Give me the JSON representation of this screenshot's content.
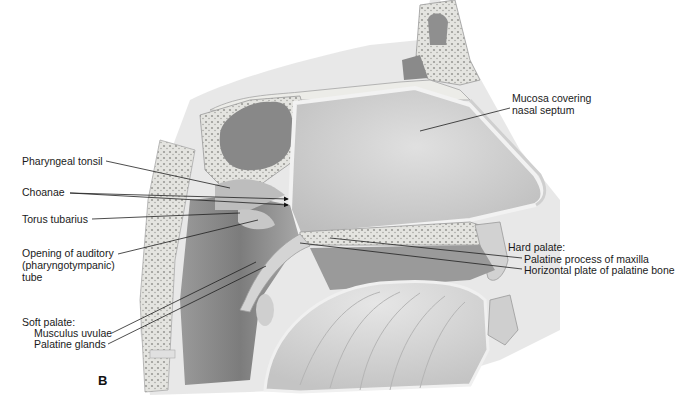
{
  "figure": {
    "panel_letter": "B"
  },
  "labels": {
    "pharyngeal_tonsil": "Pharyngeal tonsil",
    "choanae": "Choanae",
    "torus_tubarius": "Torus tubarius",
    "auditory_tube": [
      "Opening of auditory",
      "(pharyngotympanic)",
      "tube"
    ],
    "soft_palate": {
      "heading": "Soft palate:",
      "items": [
        "Musculus uvulae",
        "Palatine glands"
      ]
    },
    "mucosa": [
      "Mucosa covering",
      "nasal septum"
    ],
    "hard_palate": {
      "heading": "Hard palate:",
      "items": [
        "Palatine process of maxilla",
        "Horizontal plate of palatine bone"
      ]
    }
  },
  "colors": {
    "background": "#ffffff",
    "tissue_light": "#d9d9d9",
    "tissue_mid": "#b3b3b3",
    "tissue_dark": "#8a8a8a",
    "bone": "#e8e8e6",
    "leader_line": "#222222"
  }
}
